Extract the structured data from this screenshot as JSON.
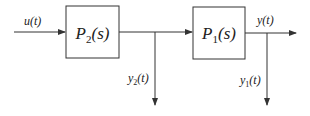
{
  "diagram": {
    "type": "block-diagram",
    "blocks": [
      {
        "id": "P2",
        "label": "P",
        "sub": "2",
        "suffix": "(s)"
      },
      {
        "id": "P1",
        "label": "P",
        "sub": "1",
        "suffix": "(s)"
      }
    ],
    "signals": {
      "input": "u(t)",
      "intermediate": {
        "label": "y",
        "sub": "2",
        "suffix": "(t)"
      },
      "output": "y(t)",
      "output_tap": {
        "label": "y",
        "sub": "1",
        "suffix": "(t)"
      }
    },
    "connections": [
      {
        "from": "u(t)",
        "to": "P2"
      },
      {
        "from": "P2",
        "to": "P1"
      },
      {
        "from": "P2",
        "to": "y2(t)"
      },
      {
        "from": "P1",
        "to": "y(t)"
      },
      {
        "from": "P1",
        "to": "y1(t)"
      }
    ],
    "colors": {
      "line": "#333333",
      "background": "#ffffff"
    }
  }
}
